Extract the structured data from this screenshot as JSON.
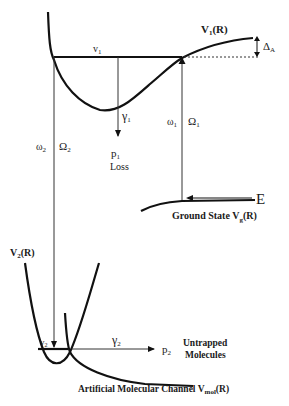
{
  "diagram": {
    "labels": {
      "V1": "V",
      "V1_sub": "1",
      "V1_arg": "(R)",
      "deltaA": "Δ",
      "deltaA_sub": "A",
      "v1": "v",
      "v1_sub": "1",
      "gamma1": "γ",
      "gamma1_sub": "1",
      "omega1": "ω",
      "omega1_sub": "1",
      "Omega1": "Ω",
      "Omega1_sub": "1",
      "omega2": "ω",
      "omega2_sub": "2",
      "Omega2": "Ω",
      "Omega2_sub": "2",
      "p1": "p",
      "p1_sub": "1",
      "loss": "Loss",
      "E": "E",
      "ground_state": "Ground State V",
      "ground_state_sub": "g",
      "ground_state_arg": "(R)",
      "V2": "V",
      "V2_sub": "2",
      "V2_arg": "(R)",
      "v2": "v",
      "v2_sub": "2",
      "gamma2": "γ",
      "gamma2_sub": "2",
      "p2": "p",
      "p2_sub": "2",
      "untrapped_1": "Untrapped",
      "untrapped_2": "Molecules",
      "channel": "Artificial Molecular Channel V",
      "channel_sub": "mol",
      "channel_arg": "(R)"
    },
    "colors": {
      "line": "#111111",
      "thin_line": "#333333",
      "text": "#1a1a1a"
    }
  }
}
